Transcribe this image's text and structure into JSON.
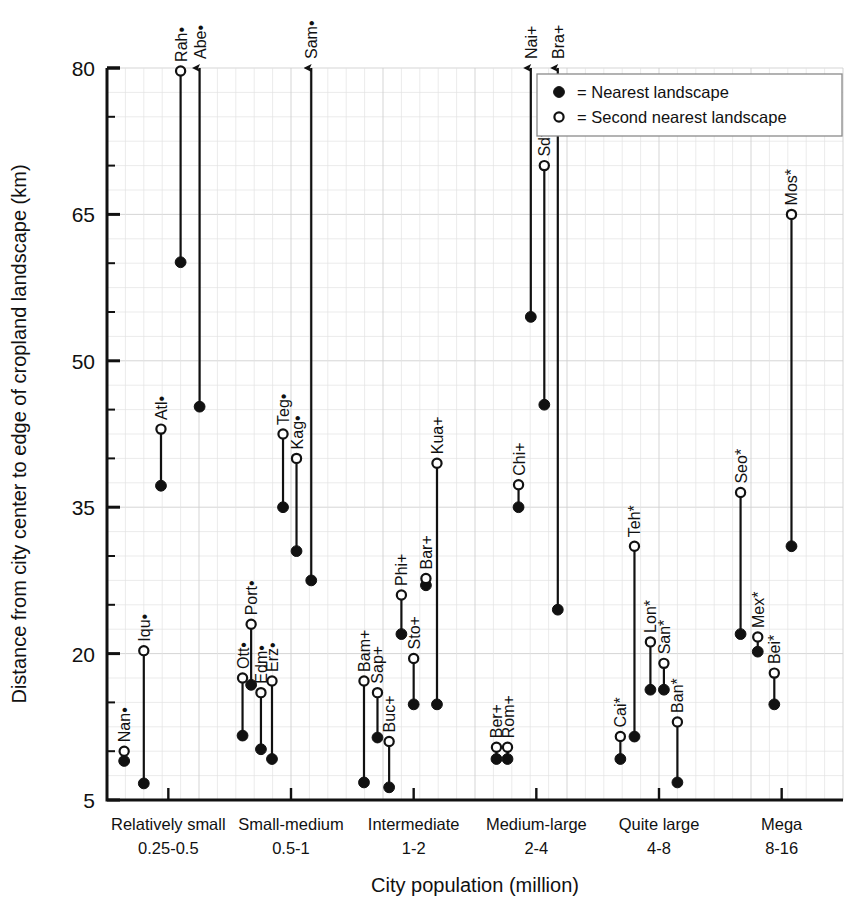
{
  "chart_data": {
    "type": "scatter",
    "title": "",
    "xlabel": "City population (million)",
    "ylabel": "Distance from city center to edge of cropland landscape (km)",
    "ylim": [
      5,
      80
    ],
    "yticks": [
      5,
      20,
      35,
      50,
      65,
      80
    ],
    "yticklabels": [
      "5",
      "20",
      "35",
      "50",
      "65",
      "80"
    ],
    "yminor_step": 5,
    "grid": true,
    "legend_position": "top-right",
    "legend": [
      {
        "marker": "filled-circle",
        "label": "= Nearest landscape"
      },
      {
        "marker": "open-circle",
        "label": "= Second nearest landscape"
      }
    ],
    "categories": [
      {
        "name": "Relatively small",
        "range": "0.25-0.5"
      },
      {
        "name": "Small-medium",
        "range": "0.5-1"
      },
      {
        "name": "Intermediate",
        "range": "1-2"
      },
      {
        "name": "Medium-large",
        "range": "2-4"
      },
      {
        "name": "Quite large",
        "range": "4-8"
      },
      {
        "name": "Mega",
        "range": "8-16"
      }
    ],
    "series_names": [
      "Nearest landscape",
      "Second nearest landscape"
    ],
    "points": [
      {
        "label": "Nan•",
        "group": 0,
        "slot": 0,
        "nearest": 9.0,
        "second": 10.0,
        "arrow": false
      },
      {
        "label": "Iqu•",
        "group": 0,
        "slot": 1,
        "nearest": 6.7,
        "second": 20.3,
        "arrow": false
      },
      {
        "label": "Atl•",
        "group": 0,
        "slot": 2,
        "nearest": 37.2,
        "second": 43.0,
        "arrow": false
      },
      {
        "label": "Rah•",
        "group": 0,
        "slot": 3,
        "nearest": 60.1,
        "second": 79.7,
        "arrow": false
      },
      {
        "label": "Abe•",
        "group": 0,
        "slot": 4,
        "nearest": 45.3,
        "second": 80.0,
        "arrow": true
      },
      {
        "label": "Ott•",
        "group": 1,
        "slot": 0,
        "nearest": 11.6,
        "second": 17.5,
        "arrow": false
      },
      {
        "label": "Port•",
        "group": 1,
        "slot": 1,
        "nearest": 16.8,
        "second": 23.0,
        "arrow": false
      },
      {
        "label": "Edm•",
        "group": 1,
        "slot": 2,
        "nearest": 10.2,
        "second": 16.0,
        "arrow": false
      },
      {
        "label": "Erz•",
        "group": 1,
        "slot": 3,
        "nearest": 9.2,
        "second": 17.2,
        "arrow": false
      },
      {
        "label": "Teg•",
        "group": 1,
        "slot": 4,
        "nearest": 35.0,
        "second": 42.5,
        "arrow": false
      },
      {
        "label": "Kag•",
        "group": 1,
        "slot": 5,
        "nearest": 30.5,
        "second": 40.0,
        "arrow": false
      },
      {
        "label": "Sam•",
        "group": 1,
        "slot": 6,
        "nearest": 27.5,
        "second": 80.0,
        "arrow": true
      },
      {
        "label": "Bam+",
        "group": 2,
        "slot": 0,
        "nearest": 6.8,
        "second": 17.2,
        "arrow": false
      },
      {
        "label": "Sap+",
        "group": 2,
        "slot": 1,
        "nearest": 11.4,
        "second": 16.0,
        "arrow": false
      },
      {
        "label": "Buc+",
        "group": 2,
        "slot": 2,
        "nearest": 6.3,
        "second": 11.0,
        "arrow": false
      },
      {
        "label": "Phi+",
        "group": 2,
        "slot": 3,
        "nearest": 22.0,
        "second": 26.0,
        "arrow": false
      },
      {
        "label": "Sto+",
        "group": 2,
        "slot": 4,
        "nearest": 14.8,
        "second": 19.5,
        "arrow": false
      },
      {
        "label": "Bar+",
        "group": 2,
        "slot": 5,
        "nearest": 27.0,
        "second": 27.7,
        "arrow": false
      },
      {
        "label": "Kua+",
        "group": 2,
        "slot": 6,
        "nearest": 14.8,
        "second": 39.5,
        "arrow": false
      },
      {
        "label": "Ber+",
        "group": 3,
        "slot": 0,
        "nearest": 9.2,
        "second": 10.4,
        "arrow": false
      },
      {
        "label": "Rom+",
        "group": 3,
        "slot": 1,
        "nearest": 9.2,
        "second": 10.4,
        "arrow": false
      },
      {
        "label": "Chi+",
        "group": 3,
        "slot": 2,
        "nearest": 35.0,
        "second": 37.3,
        "arrow": false
      },
      {
        "label": "Nai+",
        "group": 3,
        "slot": 3,
        "nearest": 54.5,
        "second": 80.0,
        "arrow": true
      },
      {
        "label": "Sdt+",
        "group": 3,
        "slot": 4,
        "nearest": 45.5,
        "second": 70.0,
        "arrow": false
      },
      {
        "label": "Bra+",
        "group": 3,
        "slot": 5,
        "nearest": 24.5,
        "second": 80.0,
        "arrow": true
      },
      {
        "label": "Cai*",
        "group": 4,
        "slot": 0,
        "nearest": 9.2,
        "second": 11.5,
        "arrow": false
      },
      {
        "label": "Teh*",
        "group": 4,
        "slot": 1,
        "nearest": 11.5,
        "second": 31.0,
        "arrow": false
      },
      {
        "label": "Lon*",
        "group": 4,
        "slot": 2,
        "nearest": 16.3,
        "second": 21.2,
        "arrow": false
      },
      {
        "label": "San*",
        "group": 4,
        "slot": 3,
        "nearest": 16.3,
        "second": 19.0,
        "arrow": false
      },
      {
        "label": "Ban*",
        "group": 4,
        "slot": 4,
        "nearest": 6.8,
        "second": 13.0,
        "arrow": false
      },
      {
        "label": "Seo*",
        "group": 5,
        "slot": 0,
        "nearest": 22.0,
        "second": 36.5,
        "arrow": false
      },
      {
        "label": "Mex*",
        "group": 5,
        "slot": 1,
        "nearest": 20.2,
        "second": 21.7,
        "arrow": false
      },
      {
        "label": "Bei*",
        "group": 5,
        "slot": 2,
        "nearest": 14.8,
        "second": 18.0,
        "arrow": false
      },
      {
        "label": "Mos*",
        "group": 5,
        "slot": 3,
        "nearest": 31.0,
        "second": 65.0,
        "arrow": false
      }
    ]
  },
  "axis": {
    "y_title": "Distance from city center to edge of cropland landscape (km)",
    "x_title": "City population (million)"
  },
  "legend": {
    "filled_label": "= Nearest landscape",
    "open_label": "= Second nearest landscape"
  }
}
